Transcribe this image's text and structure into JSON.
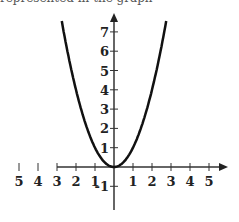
{
  "caption": "represented in the graph",
  "chart_data": {
    "type": "line",
    "title": "",
    "xlabel": "",
    "ylabel": "",
    "function": "y = x^2",
    "x_tick_labels": [
      "5",
      "4",
      "3",
      "2",
      "1",
      "1",
      "2",
      "3",
      "4",
      "5"
    ],
    "x_ticks": [
      -5,
      -4,
      -3,
      -2,
      -1,
      1,
      2,
      3,
      4,
      5
    ],
    "y_tick_labels": [
      "-1",
      "1",
      "2",
      "3",
      "4",
      "5",
      "6",
      "7"
    ],
    "y_ticks": [
      -1,
      1,
      2,
      3,
      4,
      5,
      6,
      7
    ],
    "xlim": [
      -5,
      5
    ],
    "ylim": [
      -1,
      7.5
    ],
    "series": [
      {
        "name": "parabola",
        "x": [
          -2.7,
          -2,
          -1,
          0,
          1,
          2,
          2.7
        ],
        "y": [
          7.29,
          4,
          1,
          0,
          1,
          4,
          7.29
        ]
      }
    ],
    "grid": false,
    "legend": "none"
  }
}
